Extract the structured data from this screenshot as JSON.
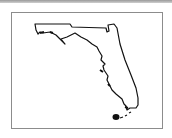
{
  "map": {
    "subject": "Florida state outline",
    "outline_color": "#111111",
    "frame_color": "#8c8c8c",
    "background_color": "#ffffff"
  }
}
